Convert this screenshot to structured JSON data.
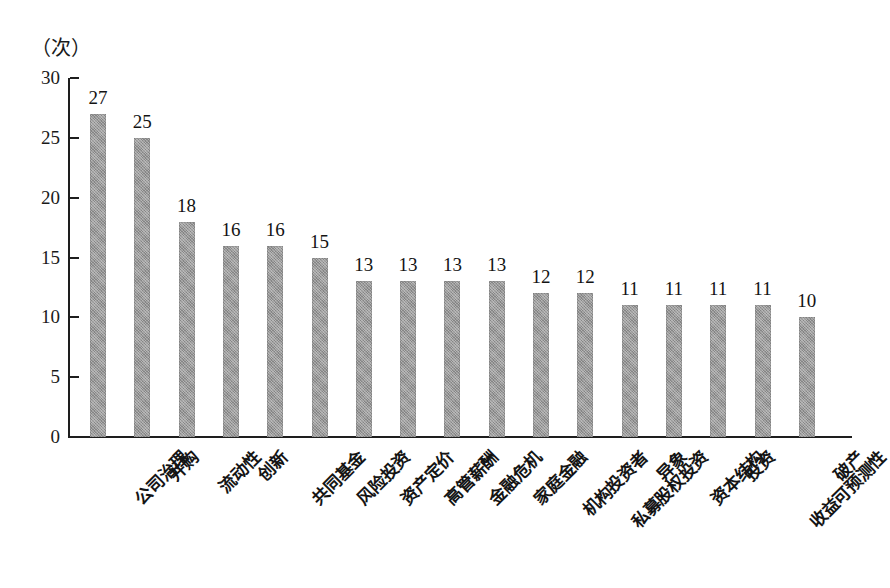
{
  "chart_data": {
    "type": "bar",
    "title": "",
    "subtitle": "",
    "xlabel": "",
    "ylabel": "（次）",
    "ylim": [
      0,
      30
    ],
    "ytick_step": 5,
    "yticks": [
      "30",
      "25",
      "20",
      "15",
      "10",
      "5",
      "0"
    ],
    "grid": false,
    "legend": null,
    "bar_color": "#9a9a9a",
    "axis_color": "#1e1e1e",
    "categories": [
      "公司治理",
      "并购",
      "流动性",
      "创新",
      "共同基金",
      "风险投资",
      "资产定价",
      "高管薪酬",
      "金融危机",
      "家庭金融",
      "机构投资者",
      "私募股权投资",
      "异象",
      "资本结构",
      "投资",
      "收益可预测性",
      "破产"
    ],
    "values": [
      27,
      25,
      18,
      16,
      16,
      15,
      13,
      13,
      13,
      13,
      12,
      12,
      11,
      11,
      11,
      11,
      10
    ],
    "value_labels": [
      "27",
      "25",
      "18",
      "16",
      "16",
      "15",
      "13",
      "13",
      "13",
      "13",
      "12",
      "12",
      "11",
      "11",
      "11",
      "11",
      "10"
    ]
  }
}
